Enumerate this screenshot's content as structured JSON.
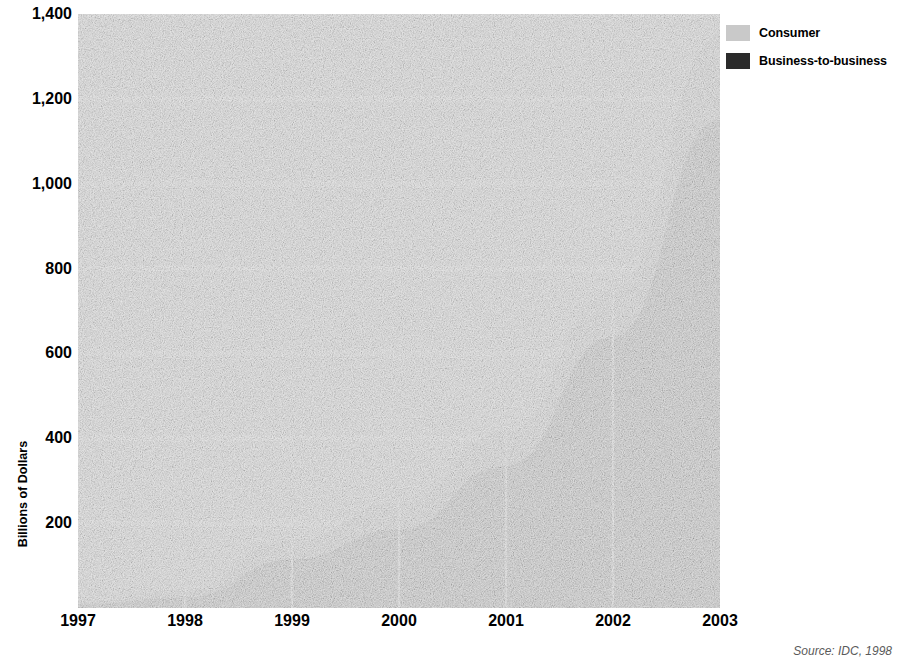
{
  "chart_data": {
    "type": "area",
    "stacked": true,
    "title": "",
    "subtitle": "",
    "xlabel": "",
    "ylabel": "Billions of Dollars",
    "categories": [
      "1997",
      "1998",
      "1999",
      "2000",
      "2001",
      "2002",
      "2003"
    ],
    "x": [
      1997,
      1998,
      1999,
      2000,
      2001,
      2002,
      2003
    ],
    "series": [
      {
        "name": "Business-to-business",
        "color": "#2b2b2b",
        "values": [
          8,
          25,
          115,
          185,
          335,
          640,
          1150
        ]
      },
      {
        "name": "Consumer",
        "color": "#c9c9c9",
        "values": [
          7,
          18,
          45,
          65,
          80,
          110,
          200
        ]
      }
    ],
    "totals": [
      15,
      43,
      160,
      250,
      415,
      750,
      1350
    ],
    "ylim": [
      0,
      1400
    ],
    "xlim": [
      1997,
      2003
    ],
    "ytick_values": [
      200,
      400,
      600,
      800,
      1000,
      1200,
      1400
    ],
    "ytick_labels": [
      "200",
      "400",
      "600",
      "800",
      "1,000",
      "1,200",
      "1,400"
    ],
    "grid": true,
    "grid_color": "#ffffff",
    "plot_background": "#e6e6e6",
    "legend_position": "top-right",
    "legend": [
      "Consumer",
      "Business-to-business"
    ],
    "source": "Source: IDC, 1998"
  },
  "axes": {
    "y_title": "Billions of Dollars",
    "y_ticks": [
      {
        "label": "1,400",
        "value": 1400
      },
      {
        "label": "1,200",
        "value": 1200
      },
      {
        "label": "1,000",
        "value": 1000
      },
      {
        "label": "800",
        "value": 800
      },
      {
        "label": "600",
        "value": 600
      },
      {
        "label": "400",
        "value": 400
      },
      {
        "label": "200",
        "value": 200
      }
    ],
    "x_ticks": [
      {
        "label": "1997"
      },
      {
        "label": "1998"
      },
      {
        "label": "1999"
      },
      {
        "label": "2000"
      },
      {
        "label": "2001"
      },
      {
        "label": "2002"
      },
      {
        "label": "2003"
      }
    ]
  },
  "legend": {
    "items": [
      {
        "label": "Consumer",
        "color": "#c9c9c9",
        "swatch": "legend-swatch-consumer"
      },
      {
        "label": "Business-to-business",
        "color": "#2b2b2b",
        "swatch": "legend-swatch-b2b"
      }
    ]
  },
  "footer": {
    "source": "Source: IDC, 1998"
  },
  "colors": {
    "consumer": "#c9c9c9",
    "business_to_business": "#2b2b2b",
    "plot_bg": "#e6e6e6",
    "gridline": "#ffffff",
    "text": "#000000"
  }
}
